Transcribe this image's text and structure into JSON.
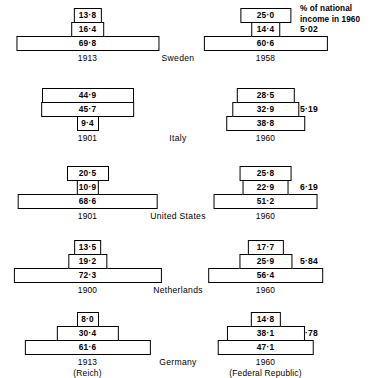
{
  "header": {
    "line1": "% of national",
    "line2": "income in 1960"
  },
  "chart_data": {
    "type": "bar",
    "title": "",
    "subtitle": "",
    "xlabel": "",
    "ylabel": "",
    "legend": [],
    "column_header": "% of national income in 1960",
    "countries": [
      {
        "name": "Sweden",
        "percent_national_income_1960": "5·02",
        "left": {
          "year": "1913",
          "sub": "",
          "bars": [
            {
              "label": "13·8",
              "value": 13.8
            },
            {
              "label": "16·4",
              "value": 16.4
            },
            {
              "label": "69·8",
              "value": 69.8
            }
          ]
        },
        "right": {
          "year": "1958",
          "sub": "",
          "bars": [
            {
              "label": "25·0",
              "value": 25.0
            },
            {
              "label": "14·4",
              "value": 14.4
            },
            {
              "label": "60·6",
              "value": 60.6
            }
          ]
        }
      },
      {
        "name": "Italy",
        "percent_national_income_1960": "5·19",
        "left": {
          "year": "1901",
          "sub": "",
          "bars": [
            {
              "label": "44·9",
              "value": 44.9
            },
            {
              "label": "45·7",
              "value": 45.7
            },
            {
              "label": "9·4",
              "value": 9.4
            }
          ]
        },
        "right": {
          "year": "1960",
          "sub": "",
          "bars": [
            {
              "label": "28·5",
              "value": 28.5
            },
            {
              "label": "32·9",
              "value": 32.9
            },
            {
              "label": "38·8",
              "value": 38.8
            }
          ]
        }
      },
      {
        "name": "United States",
        "percent_national_income_1960": "6·19",
        "left": {
          "year": "1901",
          "sub": "",
          "bars": [
            {
              "label": "20·5",
              "value": 20.5
            },
            {
              "label": "10·9",
              "value": 10.9
            },
            {
              "label": "68·6",
              "value": 68.6
            }
          ]
        },
        "right": {
          "year": "1960",
          "sub": "",
          "bars": [
            {
              "label": "25·8",
              "value": 25.8
            },
            {
              "label": "22·9",
              "value": 22.9
            },
            {
              "label": "51·2",
              "value": 51.2
            }
          ]
        }
      },
      {
        "name": "Netherlands",
        "percent_national_income_1960": "5·84",
        "left": {
          "year": "1900",
          "sub": "",
          "bars": [
            {
              "label": "13·5",
              "value": 13.5
            },
            {
              "label": "19·2",
              "value": 19.2
            },
            {
              "label": "72·3",
              "value": 72.3
            }
          ]
        },
        "right": {
          "year": "1960",
          "sub": "",
          "bars": [
            {
              "label": "17·7",
              "value": 17.7
            },
            {
              "label": "25·9",
              "value": 25.9
            },
            {
              "label": "56·4",
              "value": 56.4
            }
          ]
        }
      },
      {
        "name": "Germany",
        "percent_national_income_1960": "3·78",
        "left": {
          "year": "1913",
          "sub": "(Reich)",
          "bars": [
            {
              "label": "8·0",
              "value": 8.0
            },
            {
              "label": "30·4",
              "value": 30.4
            },
            {
              "label": "61·6",
              "value": 61.6
            }
          ]
        },
        "right": {
          "year": "1960",
          "sub": "(Federal Republic)",
          "bars": [
            {
              "label": "14·8",
              "value": 14.8
            },
            {
              "label": "38·1",
              "value": 38.1
            },
            {
              "label": "47·1",
              "value": 47.1
            }
          ]
        }
      }
    ]
  }
}
